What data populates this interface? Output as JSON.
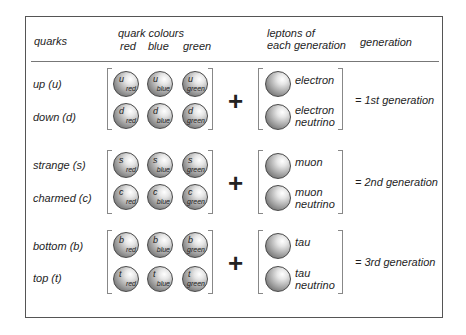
{
  "header": {
    "quarks": "quarks",
    "quark_colours": "quark colours",
    "colours": [
      "red",
      "blue",
      "green"
    ],
    "leptons_line1": "leptons of",
    "leptons_line2": "each generation",
    "generation": "generation"
  },
  "plus_sign": "+",
  "generations": [
    {
      "quarks": [
        {
          "name": "up (u)",
          "symbol": "u"
        },
        {
          "name": "down (d)",
          "symbol": "d"
        }
      ],
      "leptons": [
        {
          "line1": "electron",
          "line2": ""
        },
        {
          "line1": "electron",
          "line2": "neutrino"
        }
      ],
      "result": "= 1st generation"
    },
    {
      "quarks": [
        {
          "name": "strange (s)",
          "symbol": "s"
        },
        {
          "name": "charmed (c)",
          "symbol": "c"
        }
      ],
      "leptons": [
        {
          "line1": "muon",
          "line2": ""
        },
        {
          "line1": "muon",
          "line2": "neutrino"
        }
      ],
      "result": "= 2nd generation"
    },
    {
      "quarks": [
        {
          "name": "bottom (b)",
          "symbol": "b"
        },
        {
          "name": "top (t)",
          "symbol": "t"
        }
      ],
      "leptons": [
        {
          "line1": "tau",
          "line2": ""
        },
        {
          "line1": "tau",
          "line2": "neutrino"
        }
      ],
      "result": "= 3rd generation"
    }
  ]
}
